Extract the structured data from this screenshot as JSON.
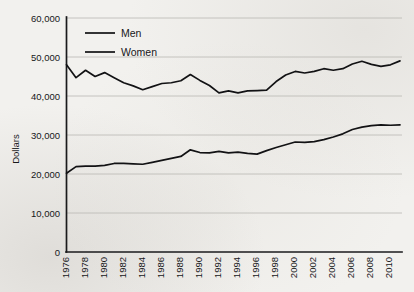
{
  "chart_data": {
    "type": "line",
    "title": "",
    "subtitle": "",
    "xlabel": "",
    "ylabel": "Dollars",
    "grid": true,
    "legend_position": "top-left-inside",
    "xlim": [
      1976,
      2011
    ],
    "ylim": [
      0,
      60000
    ],
    "ytick_labels": [
      "60,000",
      "50,000",
      "40,000",
      "30,000",
      "20,000",
      "10,000",
      "0"
    ],
    "ytick_values": [
      60000,
      50000,
      40000,
      30000,
      20000,
      10000,
      0
    ],
    "xtick_labels": [
      "1976",
      "1978",
      "1980",
      "1982",
      "1984",
      "1986",
      "1988",
      "1990",
      "1992",
      "1994",
      "1996",
      "1998",
      "2000",
      "2002",
      "2004",
      "2006",
      "2008",
      "2010"
    ],
    "xtick_values": [
      1976,
      1978,
      1980,
      1982,
      1984,
      1986,
      1988,
      1990,
      1992,
      1994,
      1996,
      1998,
      2000,
      2002,
      2004,
      2006,
      2008,
      2010
    ],
    "x": [
      1976,
      1977,
      1978,
      1979,
      1980,
      1981,
      1982,
      1983,
      1984,
      1985,
      1986,
      1987,
      1988,
      1989,
      1990,
      1991,
      1992,
      1993,
      1994,
      1995,
      1996,
      1997,
      1998,
      1999,
      2000,
      2001,
      2002,
      2003,
      2004,
      2005,
      2006,
      2007,
      2008,
      2009,
      2010,
      2011
    ],
    "series": [
      {
        "name": "Men",
        "color": "#121214",
        "values": [
          48000,
          44700,
          46600,
          45000,
          46000,
          44700,
          43400,
          42600,
          41600,
          42400,
          43200,
          43400,
          43900,
          45500,
          44000,
          42700,
          40800,
          41300,
          40800,
          41300,
          41400,
          41500,
          43700,
          45400,
          46300,
          45900,
          46300,
          47000,
          46600,
          47000,
          48200,
          48900,
          48100,
          47600,
          48000,
          49000
        ]
      },
      {
        "name": "Women",
        "color": "#121214",
        "values": [
          20200,
          21900,
          22000,
          22000,
          22200,
          22700,
          22700,
          22600,
          22500,
          23000,
          23500,
          24000,
          24500,
          26200,
          25500,
          25400,
          25800,
          25400,
          25600,
          25300,
          25100,
          26000,
          26800,
          27500,
          28200,
          28100,
          28300,
          28800,
          29500,
          30300,
          31400,
          32000,
          32400,
          32600,
          32500,
          32600
        ]
      }
    ]
  },
  "legend": {
    "entries": [
      {
        "label": "Men"
      },
      {
        "label": "Women"
      }
    ]
  },
  "axes": {
    "y_title": "Dollars"
  }
}
